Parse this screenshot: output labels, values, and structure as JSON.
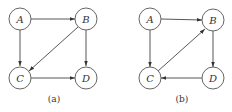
{
  "graphs": [
    {
      "caption": "(a)",
      "nodes": [
        {
          "id": "A",
          "label": "A"
        },
        {
          "id": "B",
          "label": "B"
        },
        {
          "id": "C",
          "label": "C"
        },
        {
          "id": "D",
          "label": "D"
        }
      ],
      "edges": [
        {
          "from": "A",
          "to": "B"
        },
        {
          "from": "A",
          "to": "C"
        },
        {
          "from": "B",
          "to": "C"
        },
        {
          "from": "B",
          "to": "D"
        },
        {
          "from": "C",
          "to": "D"
        }
      ]
    },
    {
      "caption": "(b)",
      "nodes": [
        {
          "id": "A",
          "label": "A"
        },
        {
          "id": "B",
          "label": "B"
        },
        {
          "id": "C",
          "label": "C"
        },
        {
          "id": "D",
          "label": "D"
        }
      ],
      "edges": [
        {
          "from": "A",
          "to": "B"
        },
        {
          "from": "A",
          "to": "C"
        },
        {
          "from": "C",
          "to": "B"
        },
        {
          "from": "B",
          "to": "D"
        },
        {
          "from": "D",
          "to": "C"
        }
      ]
    }
  ]
}
